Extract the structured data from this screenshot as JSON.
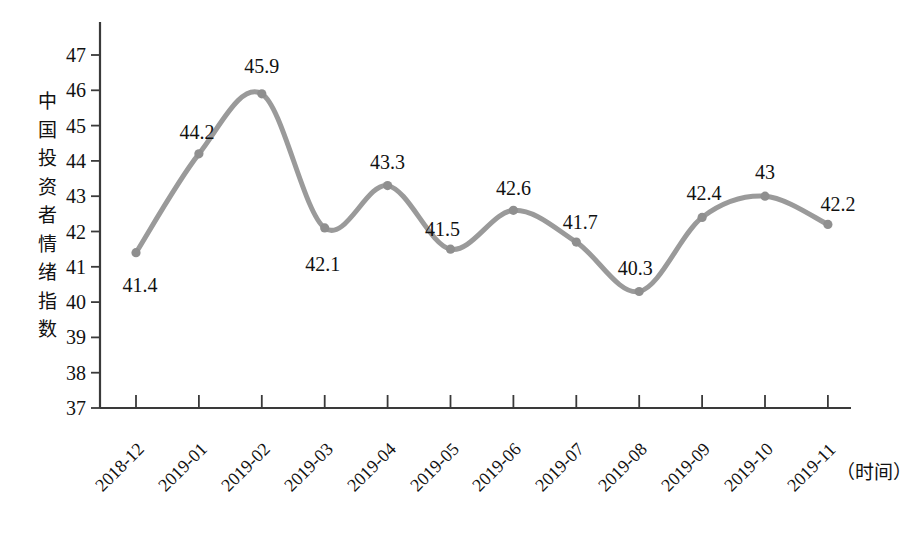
{
  "chart_data": {
    "type": "line",
    "title": "",
    "subtitle": "",
    "xlabel": "（时间）",
    "ylabel": "中国投资者情绪指数",
    "categories": [
      "2018-12",
      "2019-01",
      "2019-02",
      "2019-03",
      "2019-04",
      "2019-05",
      "2019-06",
      "2019-07",
      "2019-08",
      "2019-09",
      "2019-10",
      "2019-11"
    ],
    "values": [
      41.4,
      44.2,
      45.9,
      42.1,
      43.3,
      41.5,
      42.6,
      41.7,
      40.3,
      42.4,
      43,
      42.2
    ],
    "point_labels": [
      "41.4",
      "44.2",
      "45.9",
      "42.1",
      "43.3",
      "41.5",
      "42.6",
      "41.7",
      "40.3",
      "42.4",
      "43",
      "42.2"
    ],
    "label_positions": [
      "below",
      "above",
      "above",
      "below",
      "above",
      "above",
      "above",
      "above",
      "below",
      "above",
      "above",
      "above"
    ],
    "ylim": [
      37,
      47
    ],
    "yticks": [
      37,
      38,
      39,
      40,
      41,
      42,
      43,
      44,
      45,
      46,
      47
    ],
    "ytick_labels": [
      "37",
      "38",
      "39",
      "40",
      "41",
      "42",
      "43",
      "44",
      "45",
      "46",
      "47"
    ],
    "grid": false,
    "legend": false,
    "legend_position": "none",
    "series": [
      {
        "name": "中国投资者情绪指数",
        "values": [
          41.4,
          44.2,
          45.9,
          42.1,
          43.3,
          41.5,
          42.6,
          41.7,
          40.3,
          42.4,
          43,
          42.2
        ],
        "color": "#9a9a9a",
        "marker": "circle",
        "smooth": true
      }
    ],
    "colors": {
      "line": "#9a9a9a",
      "marker": "#8f8f8f",
      "axis": "#3a3a3a",
      "text": "#111111",
      "background": "#ffffff"
    }
  },
  "ylabel_chars": [
    "中",
    "国",
    "投",
    "资",
    "者",
    "情",
    "绪",
    "指",
    "数"
  ]
}
